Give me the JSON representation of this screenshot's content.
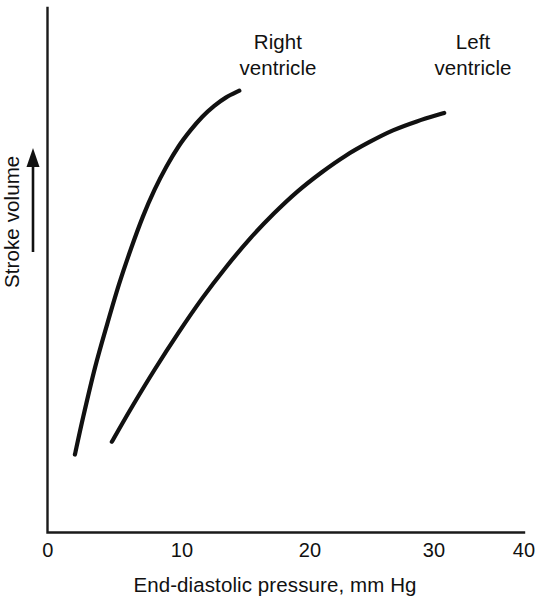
{
  "chart_data": {
    "type": "line",
    "title": "",
    "subtitle": "",
    "xlabel": "End-diastolic pressure, mm Hg",
    "ylabel": "Stroke volume",
    "ylabel_arrow": "increasing",
    "xlim": [
      0,
      40
    ],
    "ylim": [
      0,
      1
    ],
    "xticks": [
      0,
      10,
      20,
      30,
      40
    ],
    "xticklabels": [
      "0",
      "10",
      "20",
      "30",
      "40"
    ],
    "yticks": [],
    "yticklabels": [],
    "grid": false,
    "legend": "inline-annotations",
    "axis_style": "open-L-spine",
    "series": [
      {
        "name": "Right ventricle",
        "label_line1": "Right",
        "label_line2": "ventricle",
        "color": "#111111",
        "x": [
          2.3,
          3.0,
          4.0,
          5.0,
          6.0,
          7.0,
          8.0,
          9.0,
          10.0,
          11.0,
          12.0,
          13.0,
          14.0,
          15.0,
          16.1
        ],
        "y": [
          0.165,
          0.245,
          0.35,
          0.44,
          0.525,
          0.6,
          0.668,
          0.726,
          0.775,
          0.817,
          0.851,
          0.88,
          0.903,
          0.921,
          0.935
        ]
      },
      {
        "name": "Left ventricle",
        "label_line1": "Left",
        "label_line2": "ventricle",
        "color": "#111111",
        "x": [
          5.4,
          7.0,
          9.0,
          11.0,
          13.0,
          15.0,
          17.0,
          19.0,
          21.0,
          23.0,
          25.0,
          27.0,
          29.0,
          31.0,
          33.3
        ],
        "y": [
          0.192,
          0.262,
          0.345,
          0.423,
          0.496,
          0.562,
          0.622,
          0.675,
          0.722,
          0.762,
          0.797,
          0.826,
          0.851,
          0.87,
          0.888
        ]
      }
    ]
  },
  "colors": {
    "background": "#ffffff",
    "ink": "#111111",
    "axis": "#1a1a1a"
  }
}
